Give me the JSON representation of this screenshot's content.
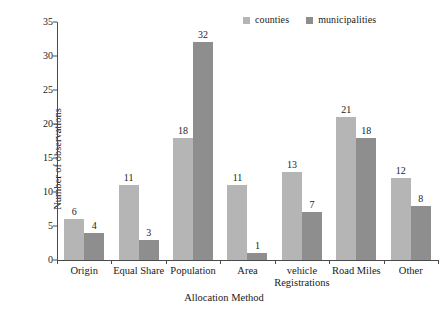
{
  "chart_data": {
    "type": "bar",
    "title": "",
    "xlabel": "Allocation Method",
    "ylabel": "Number of observations",
    "categories": [
      "Origin",
      "Equal Share",
      "Population",
      "Area",
      "vehicle Registrations",
      "Road Miles",
      "Other"
    ],
    "category_lines": [
      [
        "Origin"
      ],
      [
        "Equal Share"
      ],
      [
        "Population"
      ],
      [
        "Area"
      ],
      [
        "vehicle",
        "Registrations"
      ],
      [
        "Road Miles"
      ],
      [
        "Other"
      ]
    ],
    "series": [
      {
        "name": "counties",
        "color": "#b5b5b5",
        "values": [
          6,
          11,
          18,
          11,
          13,
          21,
          12
        ]
      },
      {
        "name": "municipalities",
        "color": "#8e8e8e",
        "values": [
          4,
          3,
          32,
          1,
          7,
          18,
          8
        ]
      }
    ],
    "ylim": [
      0,
      35
    ],
    "yticks": [
      0,
      5,
      10,
      15,
      20,
      25,
      30,
      35
    ],
    "ytick_labels": [
      "0",
      "5",
      "10",
      "15",
      "20",
      "25",
      "30",
      "35"
    ],
    "grid": false,
    "legend_position": "top-right",
    "data_labels": true,
    "background_color": "#ffffff",
    "axis_color": "#4a4a4a"
  },
  "legend": {
    "entries": [
      {
        "label": "counties"
      },
      {
        "label": "municipalities"
      }
    ]
  }
}
